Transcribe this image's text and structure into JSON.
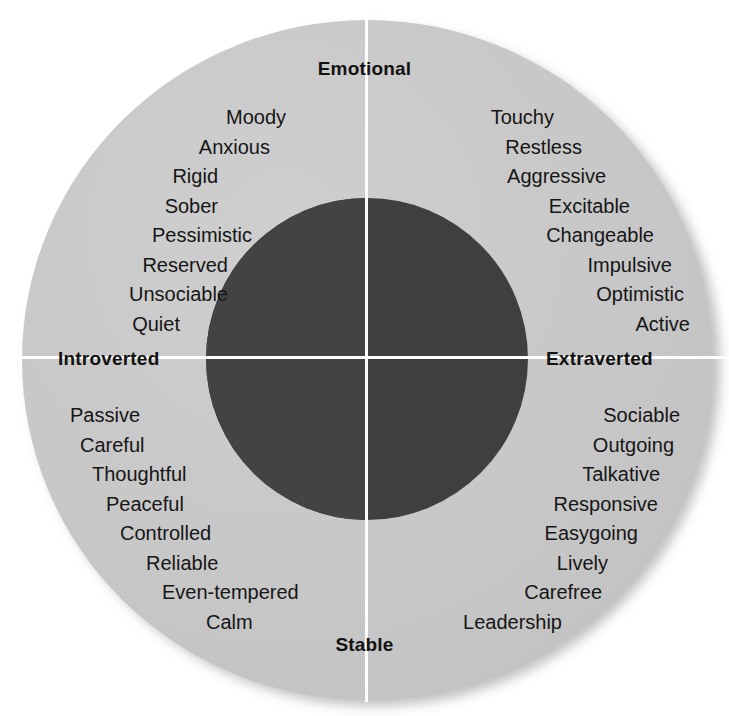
{
  "figure": {
    "colors": {
      "outer_ring": "#c9c9c9",
      "inner_circle": "#3f3f3f",
      "axis_line": "#ffffff",
      "text": "#161616",
      "background": "#ffffff"
    }
  },
  "axes": {
    "top_label": "Emotional",
    "bottom_label": "Stable",
    "left_label": "Introverted",
    "right_label": "Extraverted"
  },
  "chart_data": {
    "type": "scatter",
    "xlabel": "Introverted – Extraverted",
    "ylabel": "Stable – Emotional",
    "grid": false,
    "legend": null,
    "axis_poles": {
      "top": "Emotional",
      "bottom": "Stable",
      "left": "Introverted",
      "right": "Extraverted"
    },
    "quadrants": [
      {
        "name": "introverted-emotional",
        "x_pole": "Introverted",
        "y_pole": "Emotional",
        "position": "upper-left",
        "traits": [
          "Moody",
          "Anxious",
          "Rigid",
          "Sober",
          "Pessimistic",
          "Reserved",
          "Unsociable",
          "Quiet"
        ]
      },
      {
        "name": "extraverted-emotional",
        "x_pole": "Extraverted",
        "y_pole": "Emotional",
        "position": "upper-right",
        "traits": [
          "Touchy",
          "Restless",
          "Aggressive",
          "Excitable",
          "Changeable",
          "Impulsive",
          "Optimistic",
          "Active"
        ]
      },
      {
        "name": "introverted-stable",
        "x_pole": "Introverted",
        "y_pole": "Stable",
        "position": "lower-left",
        "traits": [
          "Passive",
          "Careful",
          "Thoughtful",
          "Peaceful",
          "Controlled",
          "Reliable",
          "Even-tempered",
          "Calm"
        ]
      },
      {
        "name": "extraverted-stable",
        "x_pole": "Extraverted",
        "y_pole": "Stable",
        "position": "lower-right",
        "traits": [
          "Sociable",
          "Outgoing",
          "Talkative",
          "Responsive",
          "Easygoing",
          "Lively",
          "Carefree",
          "Leadership"
        ]
      }
    ]
  }
}
